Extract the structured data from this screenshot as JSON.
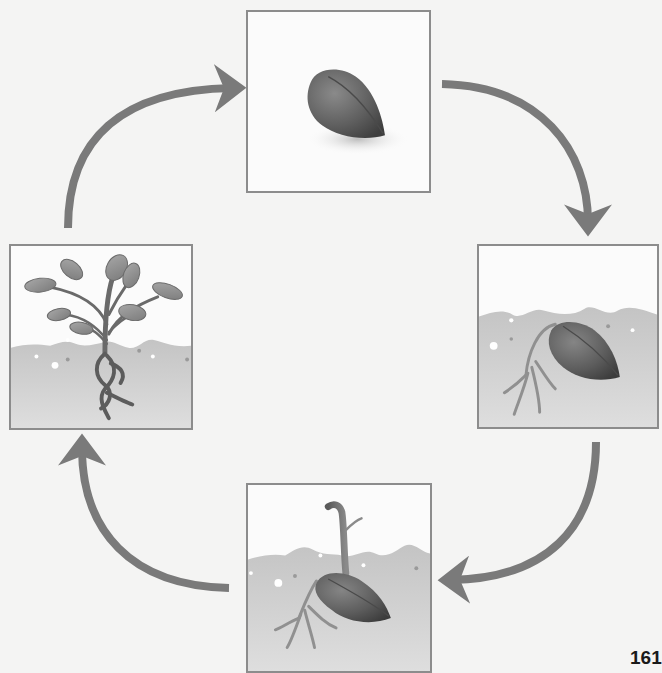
{
  "diagram": {
    "title": "Plant life cycle",
    "stages": [
      {
        "id": "seed",
        "label": "Seed"
      },
      {
        "id": "germinating-seed",
        "label": "Germinating seed with roots"
      },
      {
        "id": "seedling",
        "label": "Seedling sprouting"
      },
      {
        "id": "plant",
        "label": "Young plant with leaves and roots"
      }
    ],
    "arrows": [
      {
        "from": "seed",
        "to": "germinating-seed",
        "direction": "clockwise"
      },
      {
        "from": "germinating-seed",
        "to": "seedling",
        "direction": "clockwise"
      },
      {
        "from": "seedling",
        "to": "plant",
        "direction": "clockwise"
      },
      {
        "from": "plant",
        "to": "seed",
        "direction": "clockwise"
      }
    ],
    "colors": {
      "arrow": "#7a7a7a",
      "panel_border": "#8c8c8c",
      "soil": "#c9c9c9",
      "seed": "#5e5e5e",
      "background": "#f4f4f3"
    }
  },
  "page": {
    "number": "161"
  }
}
